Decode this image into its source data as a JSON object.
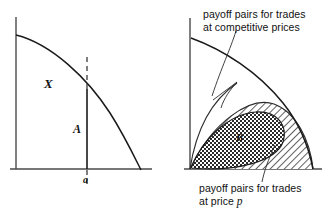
{
  "figure": {
    "type": "two-panel economics diagram",
    "background_color": "#ffffff",
    "ink_color": "#111111",
    "panels": [
      {
        "id": "left",
        "name": "endowment-and-allocation-panel",
        "labels": {
          "region": "X",
          "allocation": "A",
          "point": "a"
        }
      },
      {
        "id": "right",
        "name": "payoff-pairs-panel",
        "labels": {
          "lens_region": "B",
          "top_annotation_line1": "payoff pairs for trades",
          "top_annotation_line2": "at competitive prices",
          "bottom_annotation_line1": "payoff pairs for trades",
          "bottom_annotation_line2_prefix": "at price ",
          "bottom_annotation_line2_symbol": "p"
        }
      }
    ],
    "geometry": {
      "left_axis_origin_x": 16,
      "left_axis_origin_y": 169,
      "left_axis_top_y": 17,
      "left_axis_right_x": 152,
      "left_curve_start": [
        16,
        35
      ],
      "left_curve_end": [
        141,
        169
      ],
      "left_vline_x": 87,
      "left_vline_top_y": 90,
      "left_dash_top_y": 57,
      "left_dash_bottom_y": 186,
      "right_axis_origin_x": 190,
      "right_axis_origin_y": 169,
      "right_axis_top_y": 18,
      "right_axis_right_x": 322,
      "right_outer_curve_start": [
        191,
        38
      ],
      "right_outer_curve_end": [
        313,
        169
      ]
    },
    "fills": {
      "lens_pattern": "checkerboard",
      "wedge_pattern": "diagonal-hatch"
    }
  }
}
